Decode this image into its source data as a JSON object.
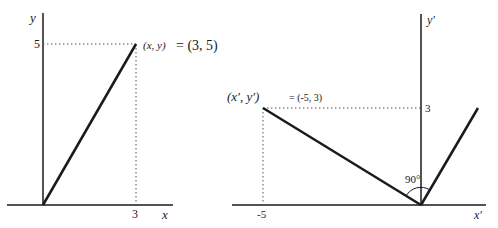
{
  "left_diagram": {
    "y_axis_label": "y",
    "x_axis_label": "x",
    "y_tick": "5",
    "x_tick": "3",
    "point_label_vars": "(x, y)",
    "point_label_eq": "= (3, 5)",
    "point": {
      "x": 3,
      "y": 5
    }
  },
  "right_diagram": {
    "y_axis_label": "y′",
    "x_axis_label": "x′",
    "y_tick": "3",
    "x_tick": "-5",
    "point_label_vars": "(x′,  y′)",
    "point_label_eq": "= (-5, 3)",
    "angle_label": "90°",
    "point": {
      "x": -5,
      "y": 3
    },
    "original_point": {
      "x": 3,
      "y": 5
    }
  },
  "colors": {
    "stroke": "#1a1a1a",
    "dotted": "#555555"
  }
}
